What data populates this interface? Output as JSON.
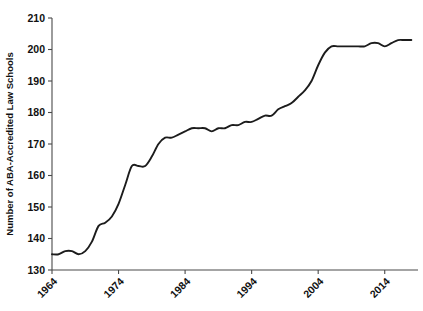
{
  "chart_data": {
    "type": "line",
    "title": "",
    "subtitle": "",
    "xlabel": "",
    "ylabel": "Number of ABA-Accredited Law Schools",
    "xlim": [
      1964,
      2019
    ],
    "ylim": [
      130,
      210
    ],
    "grid": false,
    "legend": null,
    "legend_position": "none",
    "y_ticks": [
      130,
      140,
      150,
      160,
      170,
      180,
      190,
      200,
      210
    ],
    "y_tick_labels": [
      "130",
      "140",
      "150",
      "160",
      "170",
      "180",
      "190",
      "200",
      "210"
    ],
    "x_ticks": [
      1964,
      1974,
      1984,
      1994,
      2004,
      2014
    ],
    "x_tick_labels": [
      "1964",
      "1974",
      "1984",
      "1994",
      "2004",
      "2014"
    ],
    "x_tick_label_rotation": 45,
    "line_color": "#1c1c1c",
    "axis_color": "#4a4a4a",
    "background_color": "#ffffff",
    "series": [
      {
        "name": "ABA-Accredited Law Schools",
        "x": [
          1964,
          1965,
          1966,
          1967,
          1968,
          1969,
          1970,
          1971,
          1972,
          1973,
          1974,
          1975,
          1976,
          1977,
          1978,
          1979,
          1980,
          1981,
          1982,
          1983,
          1984,
          1985,
          1986,
          1987,
          1988,
          1989,
          1990,
          1991,
          1992,
          1993,
          1994,
          1995,
          1996,
          1997,
          1998,
          1999,
          2000,
          2001,
          2002,
          2003,
          2004,
          2005,
          2006,
          2007,
          2008,
          2009,
          2010,
          2011,
          2012,
          2013,
          2014,
          2015,
          2016,
          2017,
          2018
        ],
        "values": [
          135,
          135,
          136,
          136,
          135,
          136,
          139,
          144,
          145,
          147,
          151,
          157,
          163,
          163,
          163,
          166,
          170,
          172,
          172,
          173,
          174,
          175,
          175,
          175,
          174,
          175,
          175,
          176,
          176,
          177,
          177,
          178,
          179,
          179,
          181,
          182,
          183,
          185,
          187,
          190,
          195,
          199,
          201,
          201,
          201,
          201,
          201,
          201,
          202,
          202,
          201,
          202,
          203,
          203,
          203
        ]
      }
    ]
  }
}
